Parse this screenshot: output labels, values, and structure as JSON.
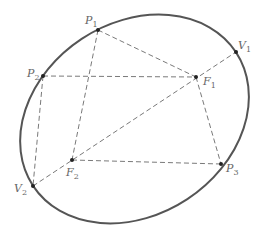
{
  "diagram": {
    "title": "",
    "ellipse": {
      "cx": 134.5,
      "cy": 119,
      "rx": 121.5,
      "ry": 96,
      "rotation": -33.4
    },
    "points": {
      "P1": {
        "x": 98,
        "y": 30,
        "label": "P",
        "sub": "1"
      },
      "P2": {
        "x": 43,
        "y": 76,
        "label": "P",
        "sub": "2"
      },
      "P3": {
        "x": 221,
        "y": 164,
        "label": "P",
        "sub": "3"
      },
      "F1": {
        "x": 196,
        "y": 77,
        "label": "F",
        "sub": "1"
      },
      "F2": {
        "x": 72,
        "y": 160,
        "label": "F",
        "sub": "2"
      },
      "V1": {
        "x": 236,
        "y": 52,
        "label": "V",
        "sub": "1"
      },
      "V2": {
        "x": 33,
        "y": 186,
        "label": "V",
        "sub": "2"
      }
    },
    "dashed_segments": [
      [
        "V2",
        "V1"
      ],
      [
        "P1",
        "F1"
      ],
      [
        "P1",
        "F2"
      ],
      [
        "P2",
        "F1"
      ],
      [
        "P2",
        "V2"
      ],
      [
        "F2",
        "P3"
      ],
      [
        "F1",
        "P3"
      ]
    ],
    "labels": {
      "P1": {
        "main": "P",
        "sub": "1"
      },
      "P2": {
        "main": "P",
        "sub": "2"
      },
      "P3": {
        "main": "P",
        "sub": "3"
      },
      "F1": {
        "main": "F",
        "sub": "1"
      },
      "F2": {
        "main": "F",
        "sub": "2"
      },
      "V1": {
        "main": "V",
        "sub": "1"
      },
      "V2": {
        "main": "V",
        "sub": "2"
      }
    }
  }
}
